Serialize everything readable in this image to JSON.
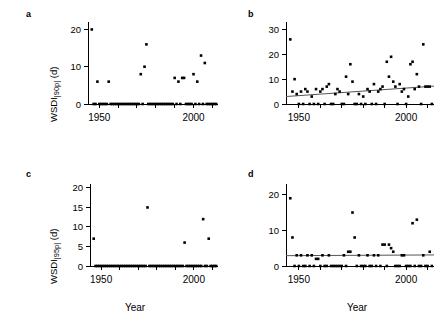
{
  "figure": {
    "panels": [
      {
        "letter": "a",
        "ylabel_main": "WSDI",
        "ylabel_sub": "|90p|",
        "ylabel_unit": " (d)",
        "xlabel": "",
        "ylim": [
          0,
          22
        ],
        "yticks": [
          0,
          10,
          20
        ],
        "ytick_labels": [
          "0",
          "10",
          "20"
        ],
        "xlim": [
          1944,
          2013
        ],
        "xticks": [
          1950,
          2000
        ],
        "xtick_labels": [
          "1950",
          "2000"
        ],
        "xminor": [
          1950,
          1960,
          1970,
          1980,
          1990,
          2000,
          2010
        ],
        "trend": null
      },
      {
        "letter": "b",
        "ylabel_main": "",
        "ylabel_sub": "",
        "ylabel_unit": "",
        "xlabel": "",
        "ylim": [
          0,
          33
        ],
        "yticks": [
          0,
          10,
          20,
          30
        ],
        "ytick_labels": [
          "0",
          "10",
          "20",
          "30"
        ],
        "xlim": [
          1944,
          2013
        ],
        "xticks": [
          1950,
          2000
        ],
        "xtick_labels": [
          "1950",
          "2000"
        ],
        "xminor": [
          1950,
          1960,
          1970,
          1980,
          1990,
          2000,
          2010
        ],
        "trend": {
          "x0": 1944,
          "y0": 3.0,
          "x1": 2013,
          "y1": 7.2
        }
      },
      {
        "letter": "c",
        "ylabel_main": "WSDI",
        "ylabel_sub": "|95p|",
        "ylabel_unit": " (d)",
        "xlabel": "Year",
        "ylim": [
          0,
          21
        ],
        "yticks": [
          0,
          5,
          10,
          15,
          20
        ],
        "ytick_labels": [
          "0",
          "5",
          "10",
          "15",
          "20"
        ],
        "xlim": [
          1944,
          2013
        ],
        "xticks": [
          1950,
          2000
        ],
        "xtick_labels": [
          "1950",
          "2000"
        ],
        "xminor": [
          1950,
          1960,
          1970,
          1980,
          1990,
          2000,
          2010
        ],
        "trend": null
      },
      {
        "letter": "d",
        "ylabel_main": "",
        "ylabel_sub": "",
        "ylabel_unit": "",
        "xlabel": "Year",
        "ylim": [
          0,
          23
        ],
        "yticks": [
          0,
          10,
          20
        ],
        "ytick_labels": [
          "0",
          "10",
          "20"
        ],
        "xlim": [
          1944,
          2013
        ],
        "xticks": [
          1950,
          2000
        ],
        "xtick_labels": [
          "1950",
          "2000"
        ],
        "xminor": [
          1950,
          1960,
          1970,
          1980,
          1990,
          2000,
          2010
        ],
        "trend": {
          "x0": 1944,
          "y0": 2.9,
          "x1": 2013,
          "y1": 3.1
        }
      }
    ]
  },
  "chart_data": [
    {
      "type": "scatter",
      "panel": "a",
      "title": "",
      "xlabel": "Year",
      "ylabel": "WSDI|90p| (d)",
      "xlim": [
        1944,
        2013
      ],
      "ylim": [
        0,
        22
      ],
      "grid": false,
      "legend": "none",
      "series": [
        {
          "name": "WSDI 90p",
          "x": [
            1946,
            1947,
            1948,
            1949,
            1950,
            1951,
            1952,
            1953,
            1954,
            1955,
            1956,
            1957,
            1958,
            1959,
            1960,
            1961,
            1962,
            1963,
            1964,
            1965,
            1966,
            1967,
            1968,
            1969,
            1970,
            1971,
            1972,
            1973,
            1974,
            1975,
            1976,
            1977,
            1978,
            1979,
            1980,
            1981,
            1982,
            1983,
            1984,
            1985,
            1986,
            1987,
            1988,
            1989,
            1990,
            1991,
            1992,
            1993,
            1994,
            1995,
            1996,
            1997,
            1998,
            1999,
            2000,
            2001,
            2002,
            2003,
            2004,
            2005,
            2006,
            2007,
            2008,
            2009,
            2010,
            2011,
            2012
          ],
          "y": [
            20,
            0,
            0,
            6,
            0,
            0,
            0,
            0,
            0,
            6,
            0,
            0,
            0,
            0,
            0,
            0,
            0,
            0,
            0,
            0,
            0,
            0,
            0,
            0,
            0,
            0,
            8,
            0,
            10,
            16,
            0,
            0,
            0,
            0,
            0,
            0,
            0,
            0,
            0,
            0,
            0,
            0,
            0,
            0,
            7,
            0,
            6,
            0,
            7,
            7,
            0,
            0,
            0,
            0,
            8,
            0,
            6,
            0,
            13,
            0,
            11,
            0,
            0,
            0,
            0,
            0,
            0
          ]
        }
      ]
    },
    {
      "type": "scatter",
      "panel": "b",
      "title": "",
      "xlabel": "Year",
      "ylabel": "WSDI|90p| (d)",
      "xlim": [
        1944,
        2013
      ],
      "ylim": [
        0,
        33
      ],
      "grid": false,
      "legend": "none",
      "trendline": {
        "slope_per_year": 0.061,
        "y_at_1944": 3.0,
        "y_at_2013": 7.2
      },
      "series": [
        {
          "name": "WSDI 90p",
          "x": [
            1946,
            1947,
            1948,
            1949,
            1950,
            1951,
            1952,
            1953,
            1954,
            1955,
            1956,
            1957,
            1958,
            1959,
            1960,
            1961,
            1962,
            1963,
            1964,
            1965,
            1966,
            1967,
            1968,
            1969,
            1970,
            1971,
            1972,
            1973,
            1974,
            1975,
            1976,
            1977,
            1978,
            1979,
            1980,
            1981,
            1982,
            1983,
            1984,
            1985,
            1986,
            1987,
            1988,
            1989,
            1990,
            1991,
            1992,
            1993,
            1994,
            1995,
            1996,
            1997,
            1998,
            1999,
            2000,
            2001,
            2002,
            2003,
            2004,
            2005,
            2006,
            2007,
            2008,
            2009,
            2010,
            2011,
            2012
          ],
          "y": [
            26,
            5,
            10,
            4,
            0,
            5,
            0,
            6,
            5,
            0,
            3,
            0,
            6,
            0,
            5,
            6,
            0,
            7,
            8,
            0,
            0,
            4,
            6,
            5,
            0,
            0,
            11,
            4,
            16,
            9,
            0,
            0,
            4,
            0,
            3,
            0,
            6,
            5,
            0,
            8,
            0,
            5,
            6,
            7,
            0,
            17,
            11,
            19,
            9,
            7,
            0,
            8,
            5,
            6,
            0,
            3,
            16,
            17,
            6,
            12,
            7,
            0,
            24,
            7,
            7,
            7,
            0
          ]
        }
      ]
    },
    {
      "type": "scatter",
      "panel": "c",
      "title": "",
      "xlabel": "Year",
      "ylabel": "WSDI|95p| (d)",
      "xlim": [
        1944,
        2013
      ],
      "ylim": [
        0,
        21
      ],
      "grid": false,
      "legend": "none",
      "series": [
        {
          "name": "WSDI 95p",
          "x": [
            1946,
            1947,
            1948,
            1949,
            1950,
            1951,
            1952,
            1953,
            1954,
            1955,
            1956,
            1957,
            1958,
            1959,
            1960,
            1961,
            1962,
            1963,
            1964,
            1965,
            1966,
            1967,
            1968,
            1969,
            1970,
            1971,
            1972,
            1973,
            1974,
            1975,
            1976,
            1977,
            1978,
            1979,
            1980,
            1981,
            1982,
            1983,
            1984,
            1985,
            1986,
            1987,
            1988,
            1989,
            1990,
            1991,
            1992,
            1993,
            1994,
            1995,
            1996,
            1997,
            1998,
            1999,
            2000,
            2001,
            2002,
            2003,
            2004,
            2005,
            2006,
            2007,
            2008,
            2009,
            2010,
            2011,
            2012
          ],
          "y": [
            7,
            0,
            0,
            0,
            0,
            0,
            0,
            0,
            0,
            0,
            0,
            0,
            0,
            0,
            0,
            0,
            0,
            0,
            0,
            0,
            0,
            0,
            0,
            0,
            0,
            0,
            0,
            0,
            0,
            15,
            0,
            0,
            0,
            0,
            0,
            0,
            0,
            0,
            0,
            0,
            0,
            0,
            0,
            0,
            0,
            0,
            0,
            0,
            0,
            6,
            0,
            0,
            0,
            0,
            0,
            0,
            0,
            0,
            0,
            12,
            0,
            0,
            7,
            0,
            0,
            0,
            0
          ]
        }
      ]
    },
    {
      "type": "scatter",
      "panel": "d",
      "title": "",
      "xlabel": "Year",
      "ylabel": "WSDI|95p| (d)",
      "xlim": [
        1944,
        2013
      ],
      "ylim": [
        0,
        23
      ],
      "grid": false,
      "legend": "none",
      "trendline": {
        "slope_per_year": 0.003,
        "y_at_1944": 2.9,
        "y_at_2013": 3.1
      },
      "series": [
        {
          "name": "WSDI 95p",
          "x": [
            1946,
            1947,
            1948,
            1949,
            1950,
            1951,
            1952,
            1953,
            1954,
            1955,
            1956,
            1957,
            1958,
            1959,
            1960,
            1961,
            1962,
            1963,
            1964,
            1965,
            1966,
            1967,
            1968,
            1969,
            1970,
            1971,
            1972,
            1973,
            1974,
            1975,
            1976,
            1977,
            1978,
            1979,
            1980,
            1981,
            1982,
            1983,
            1984,
            1985,
            1986,
            1987,
            1988,
            1989,
            1990,
            1991,
            1992,
            1993,
            1994,
            1995,
            1996,
            1997,
            1998,
            1999,
            2000,
            2001,
            2002,
            2003,
            2004,
            2005,
            2006,
            2007,
            2008,
            2009,
            2010,
            2011,
            2012
          ],
          "y": [
            19,
            8,
            0,
            3,
            0,
            3,
            0,
            0,
            3,
            0,
            3,
            0,
            2,
            2,
            0,
            3,
            0,
            0,
            3,
            0,
            0,
            0,
            0,
            0,
            0,
            3,
            0,
            4,
            4,
            15,
            8,
            0,
            3,
            0,
            0,
            0,
            3,
            0,
            0,
            3,
            0,
            3,
            0,
            6,
            6,
            0,
            6,
            5,
            4,
            0,
            0,
            0,
            3,
            3,
            0,
            0,
            0,
            12,
            0,
            13,
            0,
            0,
            3,
            0,
            0,
            4,
            0
          ]
        }
      ]
    }
  ]
}
